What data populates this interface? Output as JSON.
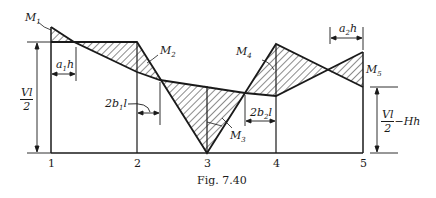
{
  "figure": {
    "caption": "Fig. 7.40",
    "colors": {
      "ink": "#1a1a1a",
      "background": "#ffffff"
    },
    "stations": [
      {
        "label": "1",
        "x": 51
      },
      {
        "label": "2",
        "x": 137
      },
      {
        "label": "3",
        "x": 207
      },
      {
        "label": "4",
        "x": 276
      },
      {
        "label": "5",
        "x": 363
      }
    ],
    "moment_labels": {
      "M1": {
        "main": "M",
        "sub": "1"
      },
      "M2": {
        "main": "M",
        "sub": "2"
      },
      "M3": {
        "main": "M",
        "sub": "3"
      },
      "M4": {
        "main": "M",
        "sub": "4"
      },
      "M5": {
        "main": "M",
        "sub": "5"
      }
    },
    "dimensions": {
      "a1h": {
        "main": "a",
        "sub": "1",
        "tail": "h"
      },
      "a2h": {
        "main": "a",
        "sub": "2",
        "tail": "h"
      },
      "2b1l": {
        "pre": "2b",
        "sub": "1",
        "tail": "l"
      },
      "2b2l": {
        "pre": "2b",
        "sub": "2",
        "tail": "l"
      },
      "left_height": {
        "num": "Vl",
        "den": "2"
      },
      "right_height": {
        "num": "Vl",
        "den": "2",
        "tail": "−Hh"
      }
    }
  }
}
